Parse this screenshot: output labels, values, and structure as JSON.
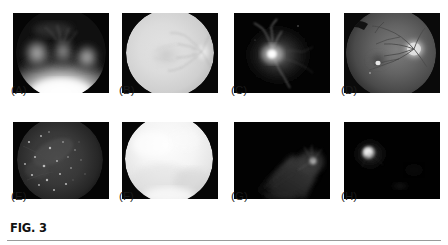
{
  "figure": {
    "caption": "FIG. 3",
    "rule_color": "#9a9a9a",
    "background": "#ffffff"
  },
  "panels": [
    {
      "id": "panel-a",
      "label": "(A)",
      "description": "Fundus photograph, overexposed inferior hemisphere with blurred bright lesions",
      "x": 13,
      "y": 13,
      "width": 96,
      "height": 80,
      "label_x": 11,
      "label_y": 95,
      "background": "#050505",
      "disc_visible": false
    },
    {
      "id": "panel-b",
      "label": "(B)",
      "description": "Bright washed-out fundus with optic disc at right margin",
      "x": 122,
      "y": 13,
      "width": 96,
      "height": 80,
      "label_x": 119,
      "label_y": 95,
      "background": "#080808",
      "disc_visible": true
    },
    {
      "id": "panel-c",
      "label": "(C)",
      "description": "Dark fundus with very bright optic disc and branching vessels",
      "x": 234,
      "y": 13,
      "width": 96,
      "height": 80,
      "label_x": 231,
      "label_y": 95,
      "background": "#030303",
      "disc_visible": true
    },
    {
      "id": "panel-d",
      "label": "(D)",
      "description": "Grey fundus, optic disc upper right, macula and small bright lesion left of centre",
      "x": 344,
      "y": 13,
      "width": 96,
      "height": 80,
      "label_x": 341,
      "label_y": 95,
      "background": "#0a0a0a",
      "disc_visible": true
    },
    {
      "id": "panel-e",
      "label": "(E)",
      "description": "Dim grey fundus with scattered small bright exudate spots",
      "x": 13,
      "y": 122,
      "width": 96,
      "height": 77,
      "label_x": 11,
      "label_y": 201,
      "background": "#050505",
      "disc_visible": false
    },
    {
      "id": "panel-f",
      "label": "(F)",
      "description": "Very bright saturated white fundus, detail washed out",
      "x": 122,
      "y": 122,
      "width": 96,
      "height": 77,
      "label_x": 119,
      "label_y": 201,
      "background": "#070707",
      "disc_visible": false
    },
    {
      "id": "panel-g",
      "label": "(G)",
      "description": "Severely underexposed fundus, faint illumination streak toward lower right with dim disc",
      "x": 234,
      "y": 122,
      "width": 96,
      "height": 77,
      "label_x": 231,
      "label_y": 201,
      "background": "#020202",
      "disc_visible": true
    },
    {
      "id": "panel-h",
      "label": "(H)",
      "description": "Near-black frame with single small bright optic disc on the left",
      "x": 344,
      "y": 122,
      "width": 96,
      "height": 77,
      "label_x": 341,
      "label_y": 201,
      "background": "#010101",
      "disc_visible": true
    }
  ]
}
